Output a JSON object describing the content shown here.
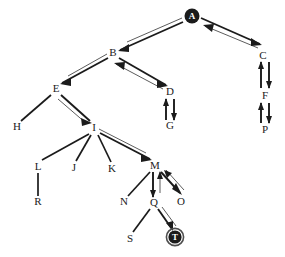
{
  "diagram": {
    "type": "node-link-graph",
    "colors": {
      "background": "#ffffff",
      "edge": "#1b1b1b",
      "edge_secondary": "#4a4a4a",
      "node_fill": "#1b1b1b",
      "node_text_on_fill": "#ffffff",
      "label": "#1b1b1b",
      "ring": "#4e4e4e"
    },
    "nodes": [
      {
        "id": "A",
        "label": "A",
        "x": 192,
        "y": 16,
        "style": "filled-circle"
      },
      {
        "id": "B",
        "label": "B",
        "x": 113,
        "y": 53,
        "style": "plain"
      },
      {
        "id": "C",
        "label": "C",
        "x": 263,
        "y": 56,
        "style": "plain"
      },
      {
        "id": "D",
        "label": "D",
        "x": 170,
        "y": 92,
        "style": "plain"
      },
      {
        "id": "E",
        "label": "E",
        "x": 56,
        "y": 89,
        "style": "plain"
      },
      {
        "id": "F",
        "label": "F",
        "x": 265,
        "y": 96,
        "style": "plain"
      },
      {
        "id": "G",
        "label": "G",
        "x": 170,
        "y": 126,
        "style": "plain"
      },
      {
        "id": "H",
        "label": "H",
        "x": 17,
        "y": 127,
        "style": "plain"
      },
      {
        "id": "I",
        "label": "I",
        "x": 94,
        "y": 128,
        "style": "plain"
      },
      {
        "id": "J",
        "label": "J",
        "x": 74,
        "y": 168,
        "style": "plain"
      },
      {
        "id": "K",
        "label": "K",
        "x": 112,
        "y": 169,
        "style": "plain"
      },
      {
        "id": "L",
        "label": "L",
        "x": 38,
        "y": 167,
        "style": "plain"
      },
      {
        "id": "M",
        "label": "M",
        "x": 155,
        "y": 166,
        "style": "plain"
      },
      {
        "id": "N",
        "label": "N",
        "x": 124,
        "y": 202,
        "style": "plain"
      },
      {
        "id": "O",
        "label": "O",
        "x": 181,
        "y": 202,
        "style": "plain"
      },
      {
        "id": "P",
        "label": "P",
        "x": 265,
        "y": 130,
        "style": "plain"
      },
      {
        "id": "Q",
        "label": "Q",
        "x": 154,
        "y": 203,
        "style": "plain"
      },
      {
        "id": "R",
        "label": "R",
        "x": 38,
        "y": 202,
        "style": "plain"
      },
      {
        "id": "S",
        "label": "S",
        "x": 130,
        "y": 239,
        "style": "plain"
      },
      {
        "id": "T",
        "label": "T",
        "x": 175,
        "y": 237,
        "style": "filled-circle-ring"
      }
    ],
    "edges": [
      {
        "from": "A",
        "to": "B",
        "style": "double",
        "direction": "forward"
      },
      {
        "from": "A",
        "to": "C",
        "style": "double",
        "direction": "both"
      },
      {
        "from": "B",
        "to": "E",
        "style": "double",
        "direction": "forward"
      },
      {
        "from": "B",
        "to": "D",
        "style": "double",
        "direction": "both"
      },
      {
        "from": "C",
        "to": "F",
        "style": "double-vertical",
        "direction": "both"
      },
      {
        "from": "D",
        "to": "G",
        "style": "double-vertical",
        "direction": "both"
      },
      {
        "from": "E",
        "to": "H",
        "style": "plain",
        "direction": "none"
      },
      {
        "from": "E",
        "to": "I",
        "style": "double",
        "direction": "forward"
      },
      {
        "from": "F",
        "to": "P",
        "style": "double-vertical",
        "direction": "both"
      },
      {
        "from": "I",
        "to": "L",
        "style": "plain",
        "direction": "none"
      },
      {
        "from": "I",
        "to": "J",
        "style": "plain",
        "direction": "none"
      },
      {
        "from": "I",
        "to": "K",
        "style": "plain",
        "direction": "none"
      },
      {
        "from": "I",
        "to": "M",
        "style": "double",
        "direction": "forward"
      },
      {
        "from": "L",
        "to": "R",
        "style": "plain",
        "direction": "none"
      },
      {
        "from": "M",
        "to": "N",
        "style": "plain",
        "direction": "none"
      },
      {
        "from": "M",
        "to": "Q",
        "style": "double-vertical",
        "direction": "forward"
      },
      {
        "from": "M",
        "to": "O",
        "style": "double",
        "direction": "both"
      },
      {
        "from": "Q",
        "to": "S",
        "style": "plain",
        "direction": "none"
      },
      {
        "from": "Q",
        "to": "T",
        "style": "double",
        "direction": "forward"
      }
    ]
  }
}
